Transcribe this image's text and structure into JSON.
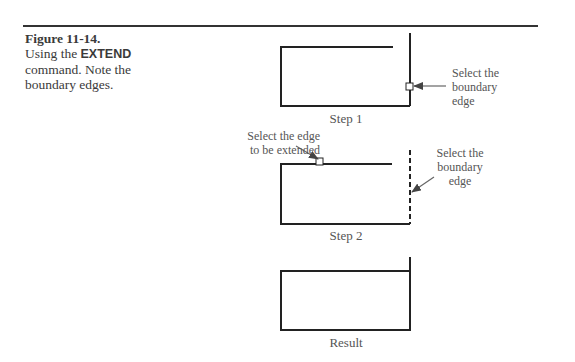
{
  "caption": {
    "figure_number": "Figure 11-14.",
    "text_before": "Using the ",
    "command": "EXTEND",
    "text_after": " command. Note the boundary edges."
  },
  "steps": [
    {
      "label": "Step 1",
      "callouts": [
        {
          "text_lines": [
            "Select the",
            "boundary",
            "edge"
          ]
        }
      ]
    },
    {
      "label": "Step 2",
      "callouts": [
        {
          "text_lines": [
            "Select the edge",
            "to be extended"
          ]
        },
        {
          "text_lines": [
            "Select the",
            "boundary",
            "edge"
          ]
        }
      ]
    },
    {
      "label": "Result",
      "callouts": []
    }
  ],
  "colors": {
    "line": "#222222",
    "text": "#555555"
  }
}
